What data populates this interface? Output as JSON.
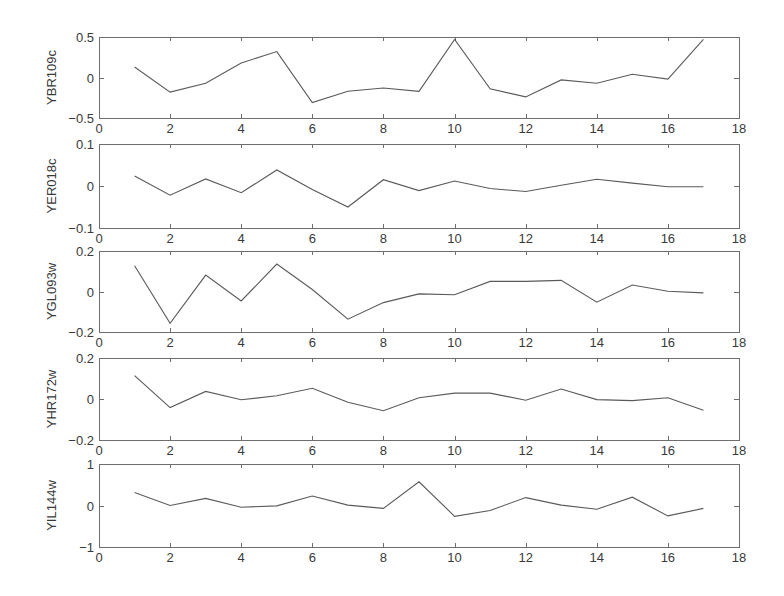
{
  "chart_data": [
    {
      "type": "line",
      "title": "",
      "xlabel": "",
      "ylabel": "YBR109c",
      "xlim": [
        0,
        18
      ],
      "ylim": [
        -0.5,
        0.5
      ],
      "xticks": [
        0,
        2,
        4,
        6,
        8,
        10,
        12,
        14,
        16,
        18
      ],
      "yticks": [
        -0.5,
        0,
        0.5
      ],
      "ytick_labels": [
        "−0.5",
        "0",
        "0.5"
      ],
      "grid": false,
      "x": [
        1,
        2,
        3,
        4,
        5,
        6,
        7,
        8,
        9,
        10,
        11,
        12,
        13,
        14,
        15,
        16,
        17
      ],
      "values": [
        0.13,
        -0.18,
        -0.07,
        0.18,
        0.32,
        -0.31,
        -0.17,
        -0.13,
        -0.17,
        0.47,
        -0.14,
        -0.24,
        -0.03,
        -0.07,
        0.04,
        -0.02,
        0.47
      ]
    },
    {
      "type": "line",
      "title": "",
      "xlabel": "",
      "ylabel": "YER018c",
      "xlim": [
        0,
        18
      ],
      "ylim": [
        -0.1,
        0.1
      ],
      "xticks": [
        0,
        2,
        4,
        6,
        8,
        10,
        12,
        14,
        16,
        18
      ],
      "yticks": [
        -0.1,
        0,
        0.1
      ],
      "ytick_labels": [
        "−0.1",
        "0",
        "0.1"
      ],
      "grid": false,
      "x": [
        1,
        2,
        3,
        4,
        5,
        6,
        7,
        8,
        9,
        10,
        11,
        12,
        13,
        14,
        15,
        16,
        17
      ],
      "values": [
        0.024,
        -0.022,
        0.017,
        -0.016,
        0.038,
        -0.008,
        -0.05,
        0.015,
        -0.011,
        0.012,
        -0.006,
        -0.013,
        0.002,
        0.016,
        0.007,
        -0.002,
        -0.002
      ]
    },
    {
      "type": "line",
      "title": "",
      "xlabel": "",
      "ylabel": "YGL093w",
      "xlim": [
        0,
        18
      ],
      "ylim": [
        -0.2,
        0.2
      ],
      "xticks": [
        0,
        2,
        4,
        6,
        8,
        10,
        12,
        14,
        16,
        18
      ],
      "yticks": [
        -0.2,
        0,
        0.2
      ],
      "ytick_labels": [
        "−0.2",
        "0",
        "0.2"
      ],
      "grid": false,
      "x": [
        1,
        2,
        3,
        4,
        5,
        6,
        7,
        8,
        9,
        10,
        11,
        12,
        13,
        14,
        15,
        16,
        17
      ],
      "values": [
        0.127,
        -0.157,
        0.081,
        -0.047,
        0.136,
        0.01,
        -0.137,
        -0.055,
        -0.012,
        -0.016,
        0.05,
        0.05,
        0.055,
        -0.053,
        0.032,
        0.001,
        -0.007
      ]
    },
    {
      "type": "line",
      "title": "",
      "xlabel": "",
      "ylabel": "YHR172w",
      "xlim": [
        0,
        18
      ],
      "ylim": [
        -0.2,
        0.2
      ],
      "xticks": [
        0,
        2,
        4,
        6,
        8,
        10,
        12,
        14,
        16,
        18
      ],
      "yticks": [
        -0.2,
        0,
        0.2
      ],
      "ytick_labels": [
        "−0.2",
        "0",
        "0.2"
      ],
      "grid": false,
      "x": [
        1,
        2,
        3,
        4,
        5,
        6,
        7,
        8,
        9,
        10,
        11,
        12,
        13,
        14,
        15,
        16,
        17
      ],
      "values": [
        0.114,
        -0.042,
        0.037,
        -0.004,
        0.016,
        0.052,
        -0.016,
        -0.057,
        0.006,
        0.029,
        0.029,
        -0.006,
        0.049,
        -0.003,
        -0.008,
        0.006,
        -0.055
      ]
    },
    {
      "type": "line",
      "title": "",
      "xlabel": "",
      "ylabel": "YIL144w",
      "xlim": [
        0,
        18
      ],
      "ylim": [
        -1,
        1
      ],
      "xticks": [
        0,
        2,
        4,
        6,
        8,
        10,
        12,
        14,
        16,
        18
      ],
      "yticks": [
        -1,
        0,
        1
      ],
      "ytick_labels": [
        "−1",
        "0",
        "1"
      ],
      "grid": false,
      "x": [
        1,
        2,
        3,
        4,
        5,
        6,
        7,
        8,
        9,
        10,
        11,
        12,
        13,
        14,
        15,
        16,
        17
      ],
      "values": [
        0.31,
        0.0,
        0.17,
        -0.04,
        -0.01,
        0.23,
        0.01,
        -0.07,
        0.57,
        -0.26,
        -0.12,
        0.19,
        0.01,
        -0.09,
        0.2,
        -0.25,
        -0.07
      ]
    }
  ],
  "layout": {
    "plot_left": 99,
    "plot_right": 739,
    "panels": [
      {
        "top": 37,
        "bottom": 118
      },
      {
        "top": 144,
        "bottom": 228
      },
      {
        "top": 251,
        "bottom": 332
      },
      {
        "top": 358,
        "bottom": 440
      },
      {
        "top": 464,
        "bottom": 547
      }
    ],
    "line_color": "#5a5a5a",
    "axis_color": "#6e6e6e"
  }
}
